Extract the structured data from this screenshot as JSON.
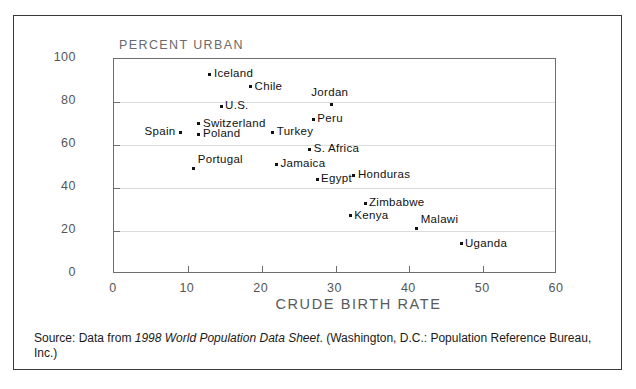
{
  "chart_data": {
    "type": "scatter",
    "title": "",
    "xlabel": "CRUDE BIRTH RATE",
    "ylabel": "PERCENT URBAN",
    "xlim": [
      0,
      60
    ],
    "ylim": [
      0,
      100
    ],
    "xticks": [
      0,
      10,
      20,
      30,
      40,
      50,
      60
    ],
    "yticks": [
      0,
      20,
      40,
      60,
      80,
      100
    ],
    "grid": true,
    "legend": "none",
    "points": [
      {
        "label": "Iceland",
        "x": 13.0,
        "y": 93,
        "label_pos": "right"
      },
      {
        "label": "Chile",
        "x": 18.5,
        "y": 87,
        "label_pos": "right"
      },
      {
        "label": "Jordan",
        "x": 29.5,
        "y": 79,
        "label_pos": "above"
      },
      {
        "label": "U.S.",
        "x": 14.5,
        "y": 78,
        "label_pos": "right"
      },
      {
        "label": "Peru",
        "x": 27.0,
        "y": 72,
        "label_pos": "right"
      },
      {
        "label": "Switzerland",
        "x": 11.5,
        "y": 70,
        "label_pos": "right"
      },
      {
        "label": "Spain",
        "x": 9.0,
        "y": 66,
        "label_pos": "left"
      },
      {
        "label": "Turkey",
        "x": 21.5,
        "y": 66,
        "label_pos": "right"
      },
      {
        "label": "Poland",
        "x": 11.5,
        "y": 65,
        "label_pos": "right"
      },
      {
        "label": "S. Africa",
        "x": 26.5,
        "y": 58,
        "label_pos": "right"
      },
      {
        "label": "Jamaica",
        "x": 22.0,
        "y": 51,
        "label_pos": "right"
      },
      {
        "label": "Portugal",
        "x": 10.8,
        "y": 49,
        "label_pos": "above-right"
      },
      {
        "label": "Honduras",
        "x": 32.5,
        "y": 46,
        "label_pos": "right"
      },
      {
        "label": "Egypt",
        "x": 27.5,
        "y": 44,
        "label_pos": "right"
      },
      {
        "label": "Zimbabwe",
        "x": 34.0,
        "y": 33,
        "label_pos": "right"
      },
      {
        "label": "Kenya",
        "x": 32.0,
        "y": 27,
        "label_pos": "right"
      },
      {
        "label": "Malawi",
        "x": 41.0,
        "y": 21,
        "label_pos": "above-right"
      },
      {
        "label": "Uganda",
        "x": 47.0,
        "y": 14,
        "label_pos": "right"
      }
    ]
  },
  "axis": {
    "y_title": "PERCENT URBAN",
    "x_title": "CRUDE BIRTH RATE",
    "y_tick_labels": [
      "0",
      "20",
      "40",
      "60",
      "80",
      "100"
    ],
    "x_tick_labels": [
      "0",
      "10",
      "20",
      "30",
      "40",
      "50",
      "60"
    ]
  },
  "source": {
    "prefix": "Source: Data from ",
    "italic_title": "1998 World Population Data Sheet",
    "suffix": ". (Washington, D.C.: Population Reference Bureau, Inc.)"
  },
  "colors": {
    "point": "#111111",
    "frame": "#6e6e6e",
    "grid": "#dcdcdc",
    "border": "#3a3a3a",
    "text": "#1a1a1a",
    "axis_label": "#5a5a5a"
  }
}
